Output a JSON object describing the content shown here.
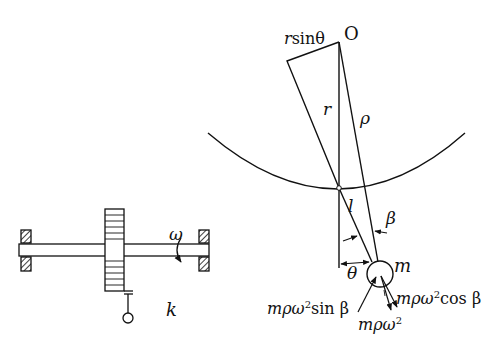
{
  "diagram": {
    "type": "mechanics-schematic",
    "colors": {
      "stroke": "#111111",
      "background": "#ffffff"
    },
    "left_figure": {
      "description": "rotating shaft with disk, supported by two bearings",
      "labels": {
        "omega": "ω",
        "k": "k"
      }
    },
    "right_figure": {
      "description": "pendulum geometry with centrifugal force decomposition",
      "labels": {
        "origin": "O",
        "r_sin_theta_r": "r",
        "r_sin_theta_rest": "sinθ",
        "r": "r",
        "rho": "ρ",
        "l": "l",
        "beta": "β",
        "theta": "θ",
        "m": "m",
        "force_sin_prefix": "mρω",
        "force_sin_exp": "2",
        "force_sin_suffix": "sin β",
        "force_cos_prefix": "mρω",
        "force_cos_exp": "2",
        "force_cos_suffix": "cos β",
        "force_total_prefix": "mρω",
        "force_total_exp": "2"
      }
    }
  }
}
